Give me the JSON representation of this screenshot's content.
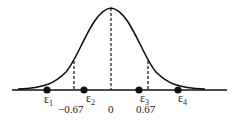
{
  "diagram": {
    "type": "normal-distribution-quantiles",
    "points": [
      {
        "label": "ε",
        "sub": "1"
      },
      {
        "label": "ε",
        "sub": "2"
      },
      {
        "label": "ε",
        "sub": "3"
      },
      {
        "label": "ε",
        "sub": "4"
      }
    ],
    "ticks": [
      {
        "label": "−0.67"
      },
      {
        "label": "0"
      },
      {
        "label": "0.67"
      }
    ],
    "colors": {
      "stroke": "#111111",
      "background": "#ffffff"
    }
  }
}
